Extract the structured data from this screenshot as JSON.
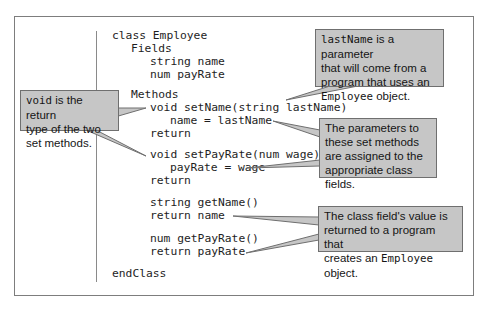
{
  "code": {
    "lines": [
      {
        "text": "class Employee",
        "x": 112,
        "y": 29
      },
      {
        "text": "Fields",
        "x": 131,
        "y": 42
      },
      {
        "text": "string name",
        "x": 150,
        "y": 55
      },
      {
        "text": "num payRate",
        "x": 150,
        "y": 68
      },
      {
        "text": "Methods",
        "x": 131,
        "y": 88
      },
      {
        "text": "void setName(string lastName)",
        "x": 150,
        "y": 101
      },
      {
        "text": "name = lastName",
        "x": 170,
        "y": 114
      },
      {
        "text": "return",
        "x": 150,
        "y": 127
      },
      {
        "text": "void setPayRate(num wage)",
        "x": 150,
        "y": 148
      },
      {
        "text": "payRate = wage",
        "x": 170,
        "y": 161
      },
      {
        "text": "return",
        "x": 150,
        "y": 174
      },
      {
        "text": "string getName()",
        "x": 150,
        "y": 196
      },
      {
        "text": "return name",
        "x": 150,
        "y": 209
      },
      {
        "text": "num getPayRate()",
        "x": 150,
        "y": 232
      },
      {
        "text": "return payRate",
        "x": 150,
        "y": 245
      },
      {
        "text": "endClass",
        "x": 112,
        "y": 267
      }
    ]
  },
  "callouts": {
    "lastname": {
      "code_term": "lastName",
      "line1_rest": " is a parameter",
      "line2": "that will come from a",
      "line3": "program that uses an",
      "line4_code": "Employee",
      "line4_rest": " object."
    },
    "void": {
      "code_term": "void",
      "line1_rest": " is the return",
      "line2": "type of the two",
      "line3": "set methods."
    },
    "parameters": {
      "line1": "The parameters to",
      "line2": "these set methods",
      "line3": "are assigned to the",
      "line4": "appropriate class fields."
    },
    "return_value": {
      "line1": "The class field's value is",
      "line2": "returned to a program that",
      "line3_rest": "creates an ",
      "line3_code": "Employee",
      "line3_end": " object."
    }
  },
  "colors": {
    "callout_fill": "#c6c6c6",
    "callout_border": "#6f6f6f",
    "frame_border": "#7d7d7d",
    "text": "#1e1e1e"
  }
}
